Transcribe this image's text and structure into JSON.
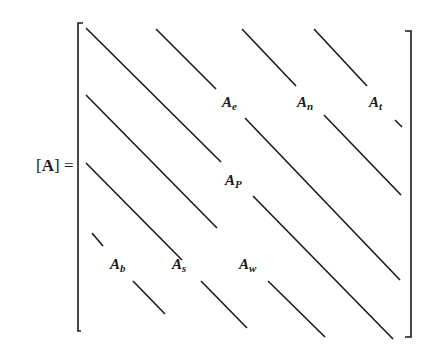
{
  "equation": {
    "lhs_open": "[",
    "lhs_symbol": "A",
    "lhs_close": "]",
    "equals": "="
  },
  "coefficients": [
    {
      "id": "ae",
      "base": "A",
      "sub": "e",
      "x": 223,
      "y": 92
    },
    {
      "id": "an",
      "base": "A",
      "sub": "n",
      "x": 297,
      "y": 92
    },
    {
      "id": "at",
      "base": "A",
      "sub": "t",
      "x": 369,
      "y": 92
    },
    {
      "id": "ap",
      "base": "A",
      "sub": "P",
      "x": 225,
      "y": 171
    },
    {
      "id": "ab",
      "base": "A",
      "sub": "b",
      "x": 111,
      "y": 255
    },
    {
      "id": "as",
      "base": "A",
      "sub": "s",
      "x": 172,
      "y": 255
    },
    {
      "id": "aw",
      "base": "A",
      "sub": "w",
      "x": 240,
      "y": 255
    }
  ],
  "colors": {
    "ink": "#1a1a1a",
    "background": "#ffffff"
  }
}
